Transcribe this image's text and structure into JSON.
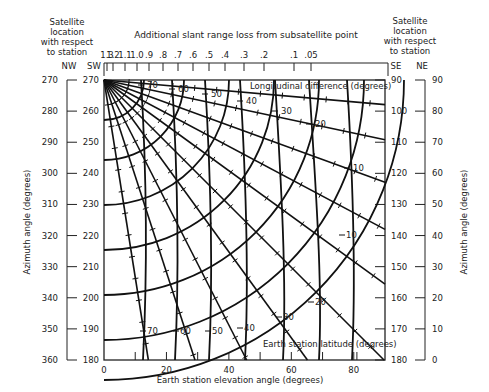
{
  "chart_data": {
    "type": "nomogram",
    "title": "Additional slant range loss from subsatellite point",
    "xlabel": "Earth station elevation angle (degrees)",
    "ylabel_left": "Azimuth angle (degrees)",
    "ylabel_right": "Azimuth angle (degrees)",
    "x_range": [
      0,
      90
    ],
    "x_ticks": [
      0,
      20,
      40,
      60,
      80
    ],
    "x_minor_ticks": [
      10,
      30,
      50,
      70,
      90
    ],
    "top_scale": {
      "label": "Additional slant range loss from subsatellite point",
      "ticks": [
        "1.3",
        "1.2",
        "1.1",
        "1.0",
        ".9",
        ".8",
        ".7",
        ".6",
        ".5",
        ".4",
        ".3",
        ".2",
        ".1",
        ".05"
      ]
    },
    "left_columns": [
      {
        "header": "NW",
        "ticks": [
          270,
          280,
          290,
          300,
          310,
          320,
          330,
          340,
          350,
          360
        ]
      },
      {
        "header": "SW",
        "ticks": [
          270,
          260,
          250,
          240,
          230,
          220,
          210,
          200,
          190,
          180
        ]
      }
    ],
    "right_columns": [
      {
        "header": "SE",
        "ticks": [
          90,
          100,
          110,
          120,
          130,
          140,
          150,
          160,
          170,
          180
        ]
      },
      {
        "header": "NE",
        "ticks": [
          90,
          80,
          70,
          60,
          50,
          40,
          30,
          20,
          10,
          0
        ]
      }
    ],
    "side_captions": {
      "left": "Satellite location with respect to station",
      "right": "Satellite location with respect to station"
    },
    "curve_families": [
      {
        "name": "Longitudinal difference (degrees)",
        "label_position": "top",
        "values": [
          70,
          60,
          50,
          40,
          30,
          20,
          10
        ]
      },
      {
        "name": "Earth station latitude (degrees)",
        "label_position": "bottom",
        "values": [
          70,
          60,
          50,
          40,
          30,
          20,
          10
        ]
      }
    ],
    "grid": false,
    "legend": "none"
  },
  "labels": {
    "title": "Additional slant range loss from subsatellite point",
    "xlabel": "Earth station elevation angle (degrees)",
    "ylabel": "Azimuth angle (degrees)",
    "sat_caption_line1": "Satellite",
    "sat_caption_line2": "location",
    "sat_caption_line3": "with respect",
    "sat_caption_line4": "to  station",
    "nw": "NW",
    "sw": "SW",
    "se": "SE",
    "ne": "NE",
    "long_diff_label": "Longitudinal difference (degrees)",
    "lat_label": "Earth station latitude (degrees)"
  }
}
